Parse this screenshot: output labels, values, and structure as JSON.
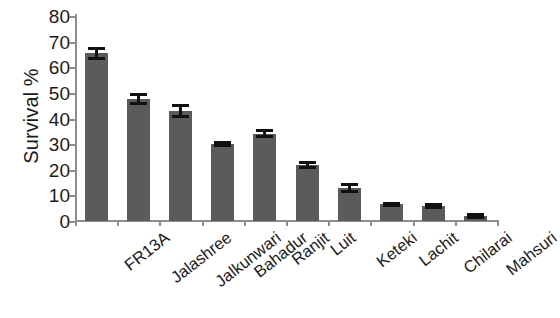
{
  "chart_data": {
    "type": "bar",
    "title": "",
    "xlabel": "",
    "ylabel": "Survival %",
    "ylim": [
      0,
      80
    ],
    "ytick_step": 10,
    "ytick_labels": [
      "80",
      "70",
      "60",
      "50",
      "40",
      "30",
      "20",
      "10",
      "0"
    ],
    "grid": false,
    "legend": "none",
    "bar_color": "#5b5b5b",
    "error_bar_color": "#111111",
    "axis_color": "#8d8d8d",
    "categories": [
      "FR13A",
      "Jalashree",
      "Jalkunwari",
      "Bahadur",
      "Ranjit",
      "Luit",
      "Keteki",
      "Lachit",
      "Chilarai",
      "Mahsuri"
    ],
    "values": [
      65.5,
      47.5,
      43.0,
      30.0,
      34.0,
      22.0,
      13.0,
      6.5,
      6.0,
      2.0
    ],
    "errors": [
      2.5,
      2.3,
      2.7,
      1.3,
      1.8,
      1.6,
      1.9,
      1.0,
      1.2,
      1.1
    ],
    "series": [
      {
        "name": "Survival %",
        "points": [
          {
            "category": "FR13A",
            "value": 65.5,
            "error": 2.5
          },
          {
            "category": "Jalashree",
            "value": 47.5,
            "error": 2.3
          },
          {
            "category": "Jalkunwari",
            "value": 43.0,
            "error": 2.7
          },
          {
            "category": "Bahadur",
            "value": 30.0,
            "error": 1.3
          },
          {
            "category": "Ranjit",
            "value": 34.0,
            "error": 1.8
          },
          {
            "category": "Luit",
            "value": 22.0,
            "error": 1.6
          },
          {
            "category": "Keteki",
            "value": 13.0,
            "error": 1.9
          },
          {
            "category": "Lachit",
            "value": 6.5,
            "error": 1.0
          },
          {
            "category": "Chilarai",
            "value": 6.0,
            "error": 1.2
          },
          {
            "category": "Mahsuri",
            "value": 2.0,
            "error": 1.1
          }
        ]
      }
    ]
  }
}
